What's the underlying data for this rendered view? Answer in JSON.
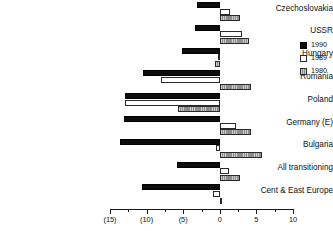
{
  "chart_data": {
    "type": "bar",
    "orientation": "horizontal",
    "title": "",
    "xlabel": "",
    "ylabel": "",
    "xlim": [
      -15,
      10
    ],
    "grid": false,
    "legend_position": "right",
    "xtick_labels": [
      "(15)",
      "(10)",
      "(5)",
      "0",
      "5",
      "10"
    ],
    "xtick_values": [
      -15,
      -10,
      -5,
      0,
      5,
      10
    ],
    "xtick_minor_values": [
      -12.5,
      -7.5,
      -2.5,
      2.5,
      7.5
    ],
    "categories": [
      "Czechoslovakia",
      "USSR",
      "Hungary",
      "Romania",
      "Poland",
      "Germany (E)",
      "Bulgaria",
      "All transitioning",
      "Cent & East Europe"
    ],
    "series": [
      {
        "name": "1990",
        "color": "#0d0d0d",
        "values": [
          -3.1,
          -3.4,
          -5.1,
          -10.5,
          -13.0,
          -13.1,
          -13.6,
          -5.9,
          -10.6
        ]
      },
      {
        "name": "1989",
        "color": "#ffffff",
        "values": [
          1.4,
          3.0,
          -0.3,
          -8.1,
          -12.9,
          2.2,
          -0.5,
          1.2,
          -0.9
        ]
      },
      {
        "name": "1980",
        "color": "#8d8d8d",
        "values": [
          2.7,
          4.0,
          -0.7,
          4.3,
          -5.7,
          4.3,
          5.7,
          2.7,
          0.3
        ]
      }
    ]
  },
  "legend": {
    "entries": [
      {
        "label": "1990",
        "swatch": "legend-swatch-1990"
      },
      {
        "label": "1989",
        "swatch": "legend-swatch-1989"
      },
      {
        "label": "1980",
        "swatch": "legend-swatch-1980"
      }
    ]
  }
}
